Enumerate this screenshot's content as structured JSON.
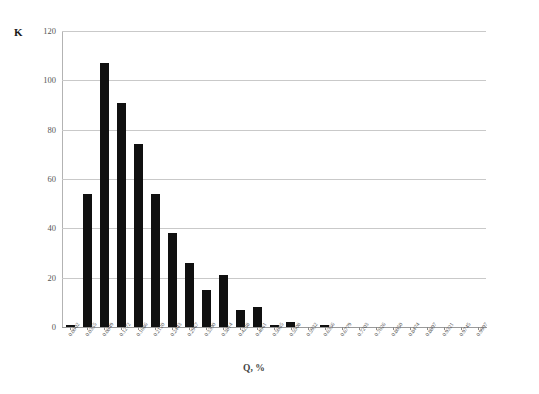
{
  "chart_data": {
    "type": "bar",
    "title": "",
    "subtitle": "",
    "xlabel": "Q, %",
    "ylabel": "K",
    "ylim": [
      0,
      120
    ],
    "yticks": [
      0,
      20,
      40,
      60,
      80,
      100,
      120
    ],
    "grid": true,
    "legend": null,
    "categories": [
      "0.0002",
      "0.0355",
      "0.0849",
      "0.1272",
      "0.1686",
      "0.2120",
      "0.2443",
      "0.2967",
      "0.3390",
      "0.3814",
      "0.4238",
      "0.4661",
      "0.5085",
      "0.5508",
      "0.5932",
      "0.6356",
      "0.6779",
      "0.7203",
      "0.7626",
      "0.8050",
      "0.8474",
      "0.8897",
      "0.9321",
      "0.9745",
      "0.9997"
    ],
    "values": [
      1,
      54,
      107,
      91,
      74,
      54,
      38,
      26,
      15,
      21,
      7,
      8,
      1,
      2,
      0,
      1,
      0,
      0,
      0,
      0,
      0,
      0,
      0,
      0,
      0
    ],
    "bar_color": "#101010",
    "grid_color": "#c9c9c9",
    "axis_color": "#9a9a9a"
  },
  "axes": {
    "y_axis_name": "K",
    "x_axis_name": "Q, %"
  }
}
